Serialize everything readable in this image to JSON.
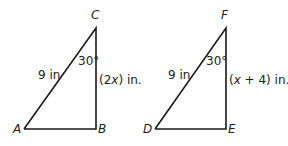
{
  "triangles": [
    {
      "vertices": {
        "top": "C",
        "bottom_left": "A",
        "bottom_right": "B"
      },
      "angle": "30°",
      "hypotenuse": "9 in",
      "vertical_side": {
        "pre": "(2",
        "var": "x",
        "post": ") in."
      }
    },
    {
      "vertices": {
        "top": "F",
        "bottom_left": "D",
        "bottom_right": "E"
      },
      "angle": "30°",
      "hypotenuse": "9 in",
      "vertical_side": {
        "pre": "(",
        "var": "x",
        "post": " + 4) in."
      }
    }
  ],
  "colors": {
    "stroke": "#1a1a1a",
    "text": "#222222"
  }
}
